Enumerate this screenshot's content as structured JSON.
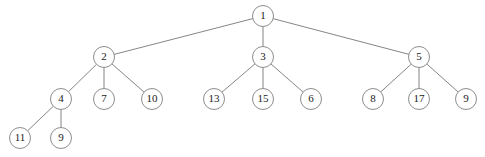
{
  "figure": {
    "kind": "tree-diagram",
    "background_color": "#ffffff",
    "node_fill_color": "#ffffff",
    "node_stroke_color": "#808080",
    "edge_color": "#777777",
    "label_color": "#1a1a1a",
    "node_radius": 10.5
  },
  "nodes": [
    {
      "id": "n1",
      "label": "1",
      "x": 263,
      "y": 16,
      "level": 0
    },
    {
      "id": "n2",
      "label": "2",
      "x": 104,
      "y": 57,
      "level": 1
    },
    {
      "id": "n3",
      "label": "3",
      "x": 263,
      "y": 57,
      "level": 1
    },
    {
      "id": "n5",
      "label": "5",
      "x": 419,
      "y": 57,
      "level": 1
    },
    {
      "id": "n4",
      "label": "4",
      "x": 61,
      "y": 99,
      "level": 2
    },
    {
      "id": "n7",
      "label": "7",
      "x": 104,
      "y": 99,
      "level": 2
    },
    {
      "id": "n10",
      "label": "10",
      "x": 152,
      "y": 99,
      "level": 2
    },
    {
      "id": "n13",
      "label": "13",
      "x": 214,
      "y": 99,
      "level": 2
    },
    {
      "id": "n15",
      "label": "15",
      "x": 263,
      "y": 99,
      "level": 2
    },
    {
      "id": "n6",
      "label": "6",
      "x": 311,
      "y": 99,
      "level": 2
    },
    {
      "id": "n8",
      "label": "8",
      "x": 373,
      "y": 99,
      "level": 2
    },
    {
      "id": "n17",
      "label": "17",
      "x": 419,
      "y": 99,
      "level": 2
    },
    {
      "id": "n9r",
      "label": "9",
      "x": 466,
      "y": 99,
      "level": 2
    },
    {
      "id": "n11",
      "label": "11",
      "x": 20,
      "y": 138,
      "level": 3
    },
    {
      "id": "n9l",
      "label": "9",
      "x": 61,
      "y": 138,
      "level": 3
    }
  ],
  "edges": [
    {
      "from": "n1",
      "to": "n2"
    },
    {
      "from": "n1",
      "to": "n3"
    },
    {
      "from": "n1",
      "to": "n5"
    },
    {
      "from": "n2",
      "to": "n4"
    },
    {
      "from": "n2",
      "to": "n7"
    },
    {
      "from": "n2",
      "to": "n10"
    },
    {
      "from": "n3",
      "to": "n13"
    },
    {
      "from": "n3",
      "to": "n15"
    },
    {
      "from": "n3",
      "to": "n6"
    },
    {
      "from": "n5",
      "to": "n8"
    },
    {
      "from": "n5",
      "to": "n17"
    },
    {
      "from": "n5",
      "to": "n9r"
    },
    {
      "from": "n4",
      "to": "n11"
    },
    {
      "from": "n4",
      "to": "n9l"
    }
  ]
}
